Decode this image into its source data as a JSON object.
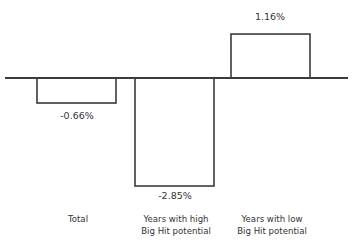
{
  "chart_data": {
    "type": "bar",
    "title": "",
    "subtitle": "",
    "xlabel": "",
    "ylabel": "",
    "grid": false,
    "legend": false,
    "legend_position": "none",
    "units": "percent",
    "axis_baseline": 0,
    "ylim": [
      -3.2,
      1.5
    ],
    "categories": [
      "Total",
      "Years with high Big Hit potential",
      "Years with low Big Hit potential"
    ],
    "category_label_lines": [
      [
        "Total"
      ],
      [
        "Years with high",
        "Big Hit potential"
      ],
      [
        "Years with low",
        "Big Hit potential"
      ]
    ],
    "values": [
      -0.66,
      -2.85,
      1.16
    ],
    "value_labels": [
      "-0.66%",
      "-2.85%",
      "1.16%"
    ],
    "series": [
      {
        "name": "",
        "values": [
          -0.66,
          -2.85,
          1.16
        ]
      }
    ],
    "colors": {
      "bar_fill": "#ffffff",
      "bar_stroke": "#3b3b3b",
      "axis": "#3b3b3b",
      "text": "#333333",
      "background": "#ffffff"
    }
  },
  "geometry": {
    "axis": {
      "x1": 5,
      "x2": 348,
      "y": 78
    },
    "bars": [
      {
        "x": 37,
        "width": 79,
        "label_cx": 77,
        "label_cy": 116
      },
      {
        "x": 135,
        "width": 79,
        "label_cx": 175,
        "label_cy": 196
      },
      {
        "x": 231,
        "width": 79,
        "label_cx": 270,
        "label_cy": 17
      }
    ],
    "category_labels": [
      {
        "cx": 78,
        "cy": 219
      },
      {
        "cx": 176,
        "cy": 219
      },
      {
        "cx": 272,
        "cy": 219
      }
    ],
    "line_height": 12,
    "px_per_unit": 37.9
  }
}
